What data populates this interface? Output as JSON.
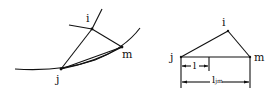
{
  "left_diagram": {
    "labels": {
      "i": "i",
      "j": "j",
      "m": "m"
    }
  },
  "right_diagram": {
    "labels": {
      "i": "i",
      "j": "j",
      "m": "m"
    },
    "dimensions": {
      "short": "l",
      "long": "l",
      "long_subscript": "jm"
    }
  },
  "colors": {
    "stroke": "#111111",
    "background": "#ffffff"
  }
}
